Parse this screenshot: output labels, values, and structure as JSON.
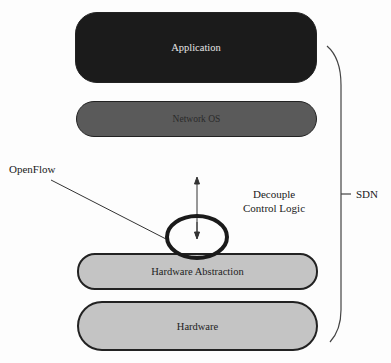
{
  "diagram": {
    "layers": [
      {
        "id": "application",
        "label": "Application",
        "fill": "#1b1b1b",
        "text_color": "#e6e6e6"
      },
      {
        "id": "network-os",
        "label": "Network OS",
        "fill": "#5a5a5a",
        "text_color": "#2a2a2a"
      },
      {
        "id": "hardware-abstraction",
        "label": "Hardware Abstraction",
        "fill": "#c4c4c4",
        "text_color": "#222222"
      },
      {
        "id": "hardware",
        "label": "Hardware",
        "fill": "#c4c4c4",
        "text_color": "#222222"
      }
    ],
    "annotations": {
      "openflow": "OpenFlow",
      "decouple_line1": "Decouple",
      "decouple_line2": "Control Logic",
      "sdn": "SDN"
    },
    "connectors": [
      {
        "type": "leader-line",
        "from": "openflow-label",
        "to": "openflow-ellipse"
      },
      {
        "type": "double-arrow",
        "between": [
          "network-os",
          "hardware-abstraction"
        ]
      },
      {
        "type": "brace",
        "spans": [
          "application",
          "hardware"
        ],
        "label": "SDN"
      }
    ]
  }
}
